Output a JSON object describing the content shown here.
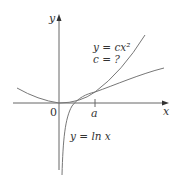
{
  "diagram": {
    "axes": {
      "x_label": "x",
      "y_label": "y",
      "origin_label": "0",
      "tick_label": "a"
    },
    "curves": [
      {
        "name": "parabola",
        "label_line1": "y = cx²",
        "label_line2": "c = ?"
      },
      {
        "name": "log",
        "label": "y = ln x"
      }
    ],
    "colors": {
      "axis": "#555555",
      "curve": "#777777",
      "text": "#333333"
    }
  }
}
